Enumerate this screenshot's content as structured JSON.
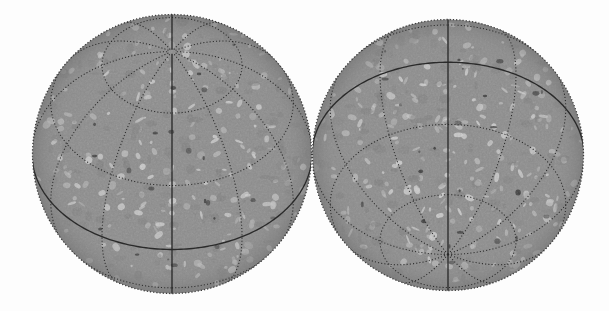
{
  "figure": {
    "title": "",
    "background_color": "#ffffff",
    "width": 609,
    "height": 311,
    "panels": [
      {
        "name": "left-hemisphere",
        "label": "",
        "view": "north-pole-tilted-toward-observer",
        "center_x": 172,
        "center_y": 154,
        "radius": 140,
        "pole_visible": "north",
        "pole_x": 171,
        "pole_y": 58,
        "b0_deg": 43,
        "disc_color": "#8d8d8d",
        "limb_color": "#3b3b3b"
      },
      {
        "name": "right-hemisphere",
        "label": "",
        "view": "south-pole-tilted-toward-observer",
        "center_x": 448,
        "center_y": 155,
        "radius": 136,
        "pole_visible": "south",
        "pole_x": 444,
        "pole_y": 253,
        "b0_deg": -43,
        "disc_color": "#8d8d8d",
        "limb_color": "#3b3b3b"
      }
    ]
  },
  "chart_data": {
    "type": "map",
    "subtitle": "",
    "projection": "orthographic",
    "xlabel": "",
    "ylabel": "",
    "grid": true,
    "legend_position": "none",
    "graticule": {
      "longitude_step_deg": 30,
      "latitude_step_deg": 30,
      "latitude_lines_deg": [
        -60,
        -30,
        0,
        30,
        60
      ],
      "longitude_lines_deg": [
        0,
        30,
        60,
        90,
        120,
        150,
        180,
        210,
        240,
        270,
        300,
        330
      ],
      "solid_lines": [
        "equator",
        "central-meridian"
      ],
      "dotted_lines": [
        "parallels",
        "meridians",
        "limb"
      ],
      "line_color": "#2a2a2a",
      "dot_spacing_px": 3
    },
    "surface": {
      "base_gray": "#8d8d8d",
      "bright_network_gray": "#d2d2d2",
      "dark_pore_gray": "#3a3a3a",
      "granule_scale_px": 6,
      "bright_feature_count": 210,
      "dark_feature_count": 46
    },
    "series": [
      {
        "name": "left-hemisphere-features",
        "values": [
          210,
          22
        ]
      },
      {
        "name": "right-hemisphere-features",
        "values": [
          240,
          24
        ]
      }
    ],
    "categories": [
      "bright network elements",
      "dark pores"
    ]
  }
}
